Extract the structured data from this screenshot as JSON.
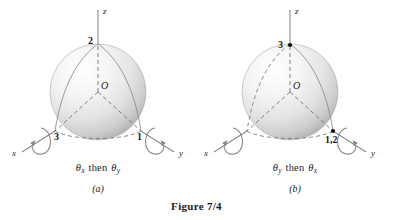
{
  "figure": {
    "caption": "Figure 7/4"
  },
  "panels": [
    {
      "id": "a",
      "label": "(a)",
      "rotation_caption": {
        "first_symbol": "θ",
        "first_subscript": "x",
        "connector": "then",
        "second_symbol": "θ",
        "second_subscript": "y"
      },
      "origin_label": "O",
      "axes": [
        {
          "name": "z-axis",
          "label": "z",
          "position": "top"
        },
        {
          "name": "x-axis",
          "label": "x",
          "position": "lower-left"
        },
        {
          "name": "y-axis",
          "label": "y",
          "position": "lower-right"
        }
      ],
      "markers": [
        {
          "name": "pole-marker",
          "label": "2",
          "axis": "z",
          "dot": false
        },
        {
          "name": "x-axis-marker",
          "label": "3",
          "axis": "x",
          "dot": false
        },
        {
          "name": "y-axis-marker",
          "label": "1",
          "axis": "y",
          "dot": false
        }
      ]
    },
    {
      "id": "b",
      "label": "(b)",
      "rotation_caption": {
        "first_symbol": "θ",
        "first_subscript": "y",
        "connector": "then",
        "second_symbol": "θ",
        "second_subscript": "x"
      },
      "origin_label": "O",
      "axes": [
        {
          "name": "z-axis",
          "label": "z",
          "position": "top"
        },
        {
          "name": "x-axis",
          "label": "x",
          "position": "lower-left"
        },
        {
          "name": "y-axis",
          "label": "y",
          "position": "lower-right"
        }
      ],
      "markers": [
        {
          "name": "pole-marker",
          "label": "3",
          "axis": "z",
          "dot": true
        },
        {
          "name": "y-axis-marker",
          "label": "1,2",
          "axis": "y",
          "dot": true
        }
      ]
    }
  ],
  "colors": {
    "sphere_highlight": "#ffffff",
    "sphere_mid": "#e8e8e8",
    "sphere_shadow": "#b9b9b9",
    "axis_line": "#8a8a8a",
    "dash_line": "#7d7d7d",
    "text": "#1a1a1a"
  }
}
